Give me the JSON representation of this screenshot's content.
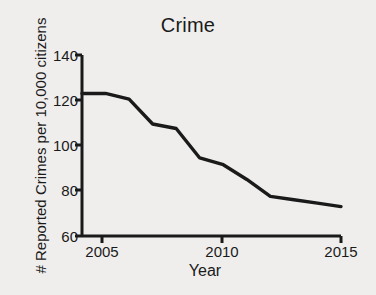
{
  "chart_data": {
    "type": "line",
    "title": "Crime",
    "xlabel": "Year",
    "ylabel": "# Reported Crimes per 10,000 citizens",
    "x": [
      2004,
      2005,
      2006,
      2007,
      2008,
      2009,
      2010,
      2011,
      2012,
      2013,
      2014,
      2015
    ],
    "values": [
      123,
      123,
      120.5,
      109.5,
      107.5,
      94.5,
      91.5,
      85,
      77.5,
      76,
      74.5,
      73
    ],
    "series": [
      {
        "name": "Reported Crimes",
        "values": [
          123,
          123,
          120.5,
          109.5,
          107.5,
          94.5,
          91.5,
          85,
          77.5,
          76,
          74.5,
          73
        ]
      }
    ],
    "xlim": [
      2004,
      2015
    ],
    "ylim": [
      60,
      140
    ],
    "yticks": [
      140,
      120,
      100,
      80,
      60
    ],
    "ytick_labels": [
      "140",
      "120",
      "100",
      "80",
      "60"
    ],
    "xticks": [
      2005,
      2010,
      2015
    ],
    "xtick_labels": [
      "2005",
      "2010",
      "2015"
    ],
    "grid": false,
    "legend": false,
    "line_color": "#1a1a1a",
    "background_color": "#efeeec"
  },
  "axes": {
    "y_tick_labels": [
      "140",
      "120",
      "100",
      "80",
      "60"
    ],
    "x_tick_labels": [
      "2005",
      "2010",
      "2015"
    ]
  }
}
